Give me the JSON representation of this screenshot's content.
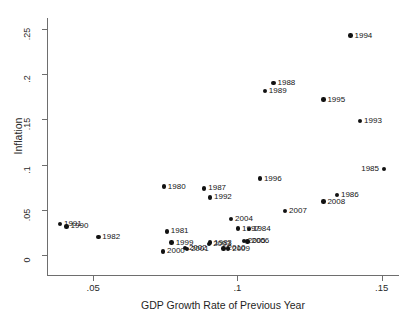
{
  "chart_data": {
    "type": "scatter",
    "title": "",
    "xlabel": "GDP Growth Rate of Previous Year",
    "ylabel": "Inflation",
    "xlim": [
      0.034,
      0.156
    ],
    "ylim": [
      -0.022,
      0.262
    ],
    "xticks": [
      0.05,
      0.1,
      0.15
    ],
    "xticklabels": [
      ".05",
      ".1",
      ".15"
    ],
    "yticks": [
      0,
      0.05,
      0.1,
      0.15,
      0.2,
      0.25
    ],
    "yticklabels": [
      "0",
      ".05",
      ".1",
      ".15",
      ".2",
      ".25"
    ],
    "grid": false,
    "legend": "none",
    "point_color": "#121212",
    "axis_color": "#6e6e6e",
    "background": "#ffffff",
    "points": [
      {
        "label": "1980",
        "x": 0.0745,
        "y": 0.0757,
        "side": "right"
      },
      {
        "label": "1981",
        "x": 0.0755,
        "y": 0.0262,
        "side": "right"
      },
      {
        "label": "1982",
        "x": 0.0518,
        "y": 0.02,
        "side": "right"
      },
      {
        "label": "1983",
        "x": 0.0905,
        "y": 0.0138,
        "side": "right"
      },
      {
        "label": "1984",
        "x": 0.104,
        "y": 0.029,
        "side": "right"
      },
      {
        "label": "1985",
        "x": 0.1508,
        "y": 0.095,
        "side": "left"
      },
      {
        "label": "1986",
        "x": 0.1345,
        "y": 0.0662,
        "side": "right"
      },
      {
        "label": "1987",
        "x": 0.0885,
        "y": 0.0738,
        "side": "right"
      },
      {
        "label": "1988",
        "x": 0.1125,
        "y": 0.1905,
        "side": "right"
      },
      {
        "label": "1989",
        "x": 0.1095,
        "y": 0.1815,
        "side": "right"
      },
      {
        "label": "1990",
        "x": 0.0408,
        "y": 0.0318,
        "side": "right"
      },
      {
        "label": "1991",
        "x": 0.0385,
        "y": 0.0345,
        "side": "right"
      },
      {
        "label": "1992",
        "x": 0.0905,
        "y": 0.0638,
        "side": "right"
      },
      {
        "label": "1993",
        "x": 0.1425,
        "y": 0.1482,
        "side": "right"
      },
      {
        "label": "1994",
        "x": 0.1392,
        "y": 0.2425,
        "side": "right"
      },
      {
        "label": "1995",
        "x": 0.1298,
        "y": 0.1718,
        "side": "right"
      },
      {
        "label": "1996",
        "x": 0.1078,
        "y": 0.0845,
        "side": "right"
      },
      {
        "label": "1997",
        "x": 0.1002,
        "y": 0.0292,
        "side": "right"
      },
      {
        "label": "1999",
        "x": 0.0772,
        "y": 0.0138,
        "side": "right"
      },
      {
        "label": "2000",
        "x": 0.0742,
        "y": 0.004,
        "side": "right"
      },
      {
        "label": "2001",
        "x": 0.0825,
        "y": 0.0068,
        "side": "right"
      },
      {
        "label": "2002",
        "x": 0.0818,
        "y": 0.0078,
        "side": "right"
      },
      {
        "label": "2003",
        "x": 0.0902,
        "y": 0.0122,
        "side": "right"
      },
      {
        "label": "2004",
        "x": 0.0978,
        "y": 0.04,
        "side": "right"
      },
      {
        "label": "2005",
        "x": 0.1022,
        "y": 0.0158,
        "side": "right"
      },
      {
        "label": "2006",
        "x": 0.1035,
        "y": 0.0152,
        "side": "right"
      },
      {
        "label": "2007",
        "x": 0.1165,
        "y": 0.0488,
        "side": "right"
      },
      {
        "label": "2008",
        "x": 0.1298,
        "y": 0.0592,
        "side": "right"
      },
      {
        "label": "2009",
        "x": 0.0968,
        "y": 0.0072,
        "side": "right"
      },
      {
        "label": "2010",
        "x": 0.0952,
        "y": 0.0075,
        "side": "right"
      }
    ]
  }
}
